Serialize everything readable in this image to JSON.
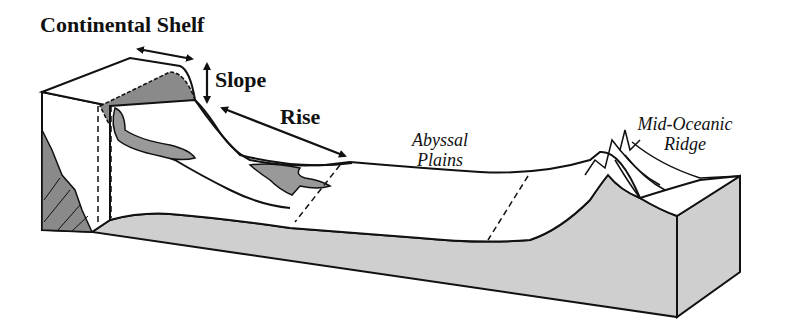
{
  "figure": {
    "type": "block-diagram"
  },
  "labels": {
    "continental_shelf": "Continental Shelf",
    "slope": "Slope",
    "rise": "Rise",
    "abyssal_plains_line1": "Abyssal",
    "abyssal_plains_line2": "Plains",
    "mid_oceanic_ridge_line1": "Mid-Oceanic",
    "mid_oceanic_ridge_line2": "Ridge"
  },
  "colors": {
    "ink": "#111111",
    "crust_fill": "#cfcfcf",
    "shelf_fill": "#8a8a8a",
    "background": "#ffffff"
  }
}
